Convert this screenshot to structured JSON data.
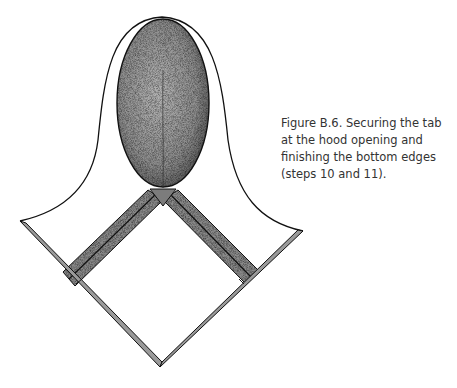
{
  "figure": {
    "label": "Figure B.6.",
    "caption_lines": [
      "Figure B.6. Securing the tab",
      "at the hood opening and",
      "finishing the bottom edges",
      "(steps 10 and 11)."
    ],
    "colors": {
      "ink": "#111111",
      "shade": "#8a8a8a",
      "paper": "#ffffff",
      "caption_text": "#333333"
    }
  }
}
